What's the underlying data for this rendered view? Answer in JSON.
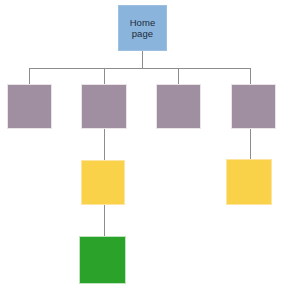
{
  "diagram": {
    "type": "site-map-hierarchy",
    "background_color": "#ffffff",
    "connector_color": "#8d8d8d",
    "palette": {
      "home": "#8ab4dc",
      "level1": "#a08fa0",
      "level2": "#fad24a",
      "level3": "#2ba32b"
    },
    "nodes": [
      {
        "id": "home",
        "label": "Home\npage",
        "color": "#8ab4dc",
        "level": 0,
        "x": 118,
        "y": 5,
        "w": 49,
        "h": 46
      },
      {
        "id": "section-1",
        "label": "",
        "color": "#a08fa0",
        "level": 1,
        "x": 7,
        "y": 84,
        "w": 45,
        "h": 45
      },
      {
        "id": "section-2",
        "label": "",
        "color": "#a08fa0",
        "level": 1,
        "x": 81,
        "y": 84,
        "w": 46,
        "h": 45
      },
      {
        "id": "section-3",
        "label": "",
        "color": "#a08fa0",
        "level": 1,
        "x": 156,
        "y": 84,
        "w": 45,
        "h": 45
      },
      {
        "id": "section-4",
        "label": "",
        "color": "#a08fa0",
        "level": 1,
        "x": 231,
        "y": 84,
        "w": 45,
        "h": 45
      },
      {
        "id": "subsection-2-1",
        "label": "",
        "color": "#fad24a",
        "level": 2,
        "x": 81,
        "y": 160,
        "w": 44,
        "h": 45
      },
      {
        "id": "subsection-4-1",
        "label": "",
        "color": "#fad24a",
        "level": 2,
        "x": 226,
        "y": 159,
        "w": 46,
        "h": 46
      },
      {
        "id": "subsection-2-1-1",
        "label": "",
        "color": "#2ba32b",
        "level": 3,
        "x": 79,
        "y": 236,
        "w": 47,
        "h": 48
      }
    ],
    "connectors": [
      {
        "id": "home-to-bus",
        "from": "home",
        "to": "bus",
        "orientation": "vertical"
      },
      {
        "id": "bus",
        "from": "bus-left",
        "to": "bus-right",
        "orientation": "horizontal"
      },
      {
        "id": "bus-to-section-1",
        "from": "bus",
        "to": "section-1",
        "orientation": "vertical"
      },
      {
        "id": "bus-to-section-2",
        "from": "bus",
        "to": "section-2",
        "orientation": "vertical"
      },
      {
        "id": "bus-to-section-3",
        "from": "bus",
        "to": "section-3",
        "orientation": "vertical"
      },
      {
        "id": "bus-to-section-4",
        "from": "bus",
        "to": "section-4",
        "orientation": "vertical"
      },
      {
        "id": "section-2-to-sub",
        "from": "section-2",
        "to": "subsection-2-1",
        "orientation": "vertical"
      },
      {
        "id": "section-4-to-sub",
        "from": "section-4",
        "to": "subsection-4-1",
        "orientation": "vertical"
      },
      {
        "id": "sub-to-green",
        "from": "subsection-2-1",
        "to": "subsection-2-1-1",
        "orientation": "vertical"
      }
    ]
  }
}
